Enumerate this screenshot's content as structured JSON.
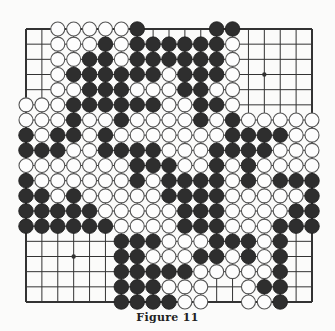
{
  "figure": {
    "caption": "Figure 11",
    "board_size": 19,
    "colors": {
      "black_stone": "#2e2e2e",
      "white_stone": "#fdfdfd",
      "stone_outline": "#555555",
      "line": "#333333",
      "background": "#fbfbfa"
    },
    "rows": [
      "..WWWWWB....BB.....",
      "..WWWBWBBBBBBW.....",
      "..WWBBWBBBBBBW.....",
      "..WBBBBBBWBBBW.....",
      "..WWBBBWWWBBWW.....",
      "WWWBBBBBBWWBBW.....",
      "WWWBWWBWWWWBWBWWWWW",
      "BWBBWBWWWWWWWBBBBWW",
      "BBBWWBBBBWWWBBBBWWW",
      "WWWWWWWBBBWWBWBWWWW",
      "BWWWWWWBWBBBBWBWBBB",
      "BBWBWWWWWBBBBWWWWWB",
      "BBBBBWWWWWBBBWWWWBB",
      "BBBBBBWWWWBBBWWWBBB",
      "......BBBWWWBBBWB..",
      "......BBWWWBBWBWB..",
      "......BBBBBWWWWWB..",
      "......BBBWWW..WBB..",
      "......BBBBWW..WWB.."
    ],
    "star_points": [
      [
        3,
        3
      ],
      [
        3,
        9
      ],
      [
        3,
        15
      ],
      [
        9,
        3
      ],
      [
        9,
        9
      ],
      [
        9,
        15
      ],
      [
        15,
        3
      ],
      [
        15,
        9
      ],
      [
        15,
        15
      ]
    ]
  }
}
